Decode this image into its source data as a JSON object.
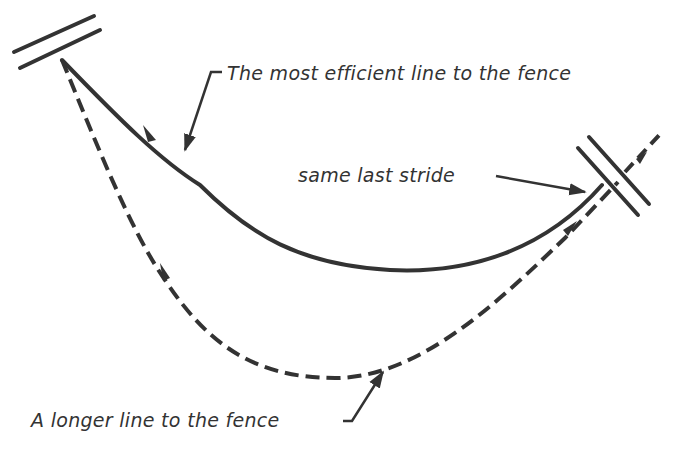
{
  "diagram": {
    "type": "riding-line-illustration",
    "colors": {
      "ink": "#333333",
      "background": "#ffffff"
    },
    "labels": {
      "efficient_line": "The most efficient line to the fence",
      "same_last_stride": "same last stride",
      "longer_line": "A longer line to the fence"
    },
    "elements": [
      {
        "name": "start-fence",
        "shape": "double parallel bars",
        "position": "top-left"
      },
      {
        "name": "target-fence",
        "shape": "double parallel bars",
        "position": "right"
      },
      {
        "name": "efficient-line",
        "style": "solid",
        "description": "shallow curve from start fence to target fence"
      },
      {
        "name": "longer-line",
        "style": "dashed",
        "description": "deep curve from start fence to target fence, continuing beyond"
      }
    ]
  }
}
